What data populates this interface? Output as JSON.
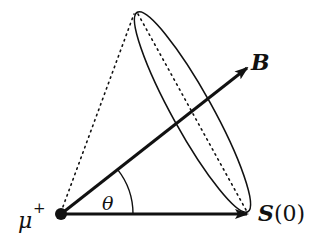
{
  "diagram": {
    "type": "spin-precession",
    "labels": {
      "particle": "μ",
      "particle_charge": "+",
      "field": "B",
      "spin_bold": "S",
      "spin_arg": "(0)",
      "angle": "θ"
    },
    "geometry": {
      "origin": [
        61,
        214
      ],
      "field_tip": [
        248,
        67
      ],
      "spin_tip": [
        248,
        214
      ],
      "cone_ellipse": {
        "cx": 192.5,
        "cy": 112,
        "rx": 20,
        "ry": 114,
        "rotate_deg": -29
      },
      "angle_arc_radius": 72
    },
    "colors": {
      "stroke": "#111111",
      "background": "#ffffff"
    }
  }
}
